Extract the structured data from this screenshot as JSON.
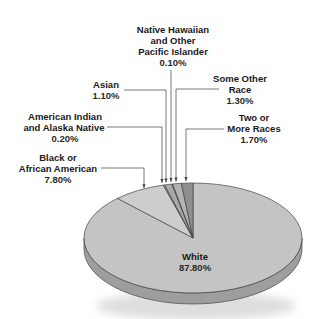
{
  "chart_data": {
    "type": "pie",
    "title": "",
    "style": "3d-tilted",
    "slices": [
      {
        "label": "White",
        "value": 87.8,
        "display": "87.80%",
        "color": "#c4c4c4"
      },
      {
        "label": "Black or African American",
        "value": 7.8,
        "display": "7.80%",
        "color": "#cdcdcd"
      },
      {
        "label": "American Indian and Alaska Native",
        "value": 0.2,
        "display": "0.20%",
        "color": "#b8b8b8"
      },
      {
        "label": "Asian",
        "value": 1.1,
        "display": "1.10%",
        "color": "#a9a9a9"
      },
      {
        "label": "Native Hawaiian and Other Pacific Islander",
        "value": 0.1,
        "display": "0.10%",
        "color": "#9a9a9a"
      },
      {
        "label": "Some Other Race",
        "value": 1.3,
        "display": "1.30%",
        "color": "#b3b3b3"
      },
      {
        "label": "Two or More Races",
        "value": 1.7,
        "display": "1.70%",
        "color": "#8e8e8e"
      }
    ],
    "labels": {
      "white": {
        "lines": [
          "White"
        ],
        "value": "87.80%"
      },
      "black": {
        "lines": [
          "Black or",
          "African American"
        ],
        "value": "7.80%"
      },
      "aian": {
        "lines": [
          "American Indian",
          "and Alaska Native"
        ],
        "value": "0.20%"
      },
      "asian": {
        "lines": [
          "Asian"
        ],
        "value": "1.10%"
      },
      "nhpi": {
        "lines": [
          "Native Hawaiian",
          "and Other",
          "Pacific Islander"
        ],
        "value": "0.10%"
      },
      "other": {
        "lines": [
          "Some Other",
          "Race"
        ],
        "value": "1.30%"
      },
      "two": {
        "lines": [
          "Two or",
          "More Races"
        ],
        "value": "1.70%"
      }
    },
    "legend": "none"
  }
}
